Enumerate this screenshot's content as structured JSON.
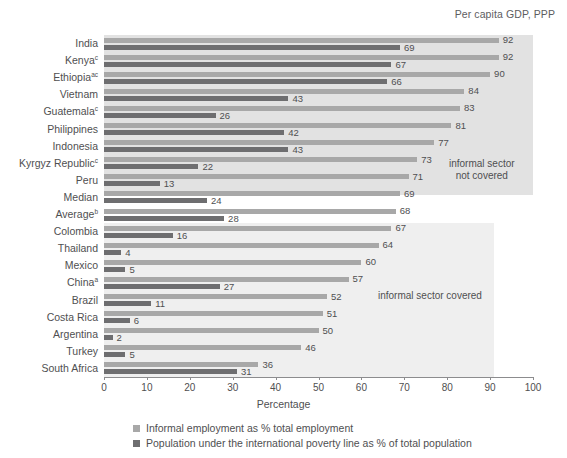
{
  "annotations": {
    "gdp_note": "Per capita GDP, PPP",
    "region_not_covered_line1": "informal sector",
    "region_not_covered_line2": "not covered",
    "region_covered": "informal sector covered"
  },
  "legend": {
    "items": [
      {
        "label": "Informal employment as % total employment",
        "color": "#a8a8a8",
        "key": "informal_employment"
      },
      {
        "label": "Population under the international poverty line as % of total population",
        "color": "#6e6e70",
        "key": "poverty"
      }
    ]
  },
  "chart_data": {
    "type": "bar",
    "orientation": "horizontal",
    "title": "",
    "subtitle": "",
    "xlabel": "Percentage",
    "ylabel": "",
    "xlim": [
      0,
      100
    ],
    "xticks": [
      0,
      10,
      20,
      30,
      40,
      50,
      60,
      70,
      80,
      90,
      100
    ],
    "grid": false,
    "legend_position": "bottom",
    "categories": [
      "India",
      "Kenya",
      "Ethiopia",
      "Vietnam",
      "Guatemala",
      "Philippines",
      "Indonesia",
      "Kyrgyz Republic",
      "Peru",
      "Median",
      "Average",
      "Colombia",
      "Thailand",
      "Mexico",
      "China",
      "Brazil",
      "Costa Rica",
      "Argentina",
      "Turkey",
      "South Africa"
    ],
    "category_footnotes": [
      "",
      "c",
      "ac",
      "",
      "c",
      "",
      "",
      "c",
      "",
      "",
      "b",
      "",
      "",
      "",
      "a",
      "",
      "",
      "",
      "",
      ""
    ],
    "series": [
      {
        "name": "Informal employment as % total employment",
        "color": "#a8a8a8",
        "values": [
          92,
          92,
          90,
          84,
          83,
          81,
          77,
          73,
          71,
          69,
          68,
          67,
          64,
          60,
          57,
          52,
          51,
          50,
          46,
          36
        ]
      },
      {
        "name": "Population under the international poverty line as % of total population",
        "color": "#6e6e70",
        "values": [
          69,
          67,
          66,
          43,
          26,
          42,
          43,
          22,
          13,
          24,
          28,
          16,
          4,
          5,
          27,
          11,
          6,
          2,
          5,
          31
        ]
      }
    ],
    "shaded_regions": [
      {
        "label": "informal sector not covered",
        "categories_from": "India",
        "categories_to": "Peru"
      },
      {
        "label": "informal sector covered",
        "categories_from": "Colombia",
        "categories_to": "Turkey"
      }
    ]
  }
}
